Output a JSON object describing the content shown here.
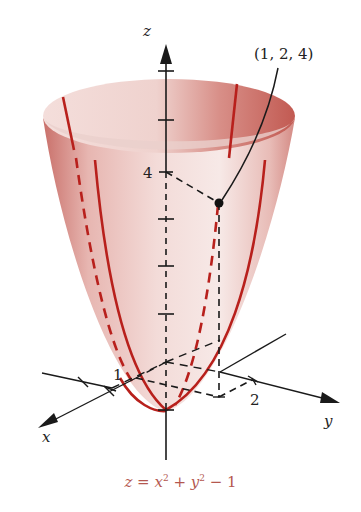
{
  "figure": {
    "axes": {
      "x_label": "x",
      "y_label": "y",
      "z_label": "z"
    },
    "tick_labels": {
      "x_tick": "1",
      "y_tick": "2",
      "z_tick": "4"
    },
    "point": {
      "label": "(1, 2, 4)",
      "x": 1,
      "y": 2,
      "z": 4
    },
    "surface": {
      "name": "paraboloid",
      "equation_lhs": "z",
      "equation_eq": " = ",
      "equation_x": "x",
      "equation_x_exp": "2",
      "equation_plus": " + ",
      "equation_y": "y",
      "equation_y_exp": "2",
      "equation_minus_one": " − 1",
      "equation_text": "z = x² + y² − 1"
    },
    "colors": {
      "surface_light": "#f6e6e4",
      "surface_mid": "#e2a8a2",
      "surface_dark": "#c8625a",
      "trace_red": "#b8201c",
      "caption": "#b4574f",
      "axis": "#1a1a1a"
    }
  }
}
